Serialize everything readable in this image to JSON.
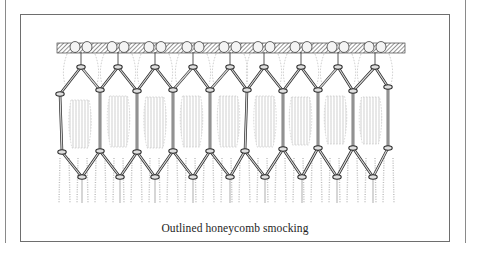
{
  "figure": {
    "caption": "Outlined honeycomb smocking",
    "illustration_subject": "outlined honeycomb smocking stitch diagram",
    "colors": {
      "ink": "#2a2a2a",
      "thread_fill": "#d8d8d8",
      "band_hatch": "#4a4a4a",
      "fabric_shade": "#bdbdbd",
      "frame": "#6e6e6e",
      "rule": "#8a8a8a"
    },
    "geometry": {
      "band": {
        "x1": 57,
        "x2": 405,
        "y1": 43,
        "y2": 53
      },
      "top_nodes": {
        "y": 67,
        "x": [
          81,
          118,
          155,
          193,
          230,
          264,
          301,
          338,
          375
        ]
      },
      "upper_side_nodes": {
        "y": [
          94,
          90,
          91,
          90,
          90,
          90,
          91,
          90,
          91,
          87
        ],
        "x": [
          60,
          100,
          137,
          173,
          210,
          247,
          283,
          318,
          353,
          388
        ]
      },
      "lower_side_nodes": {
        "y": [
          152,
          151,
          152,
          151,
          151,
          151,
          149,
          148,
          148,
          148
        ],
        "x": [
          62,
          100,
          137,
          173,
          210,
          245,
          283,
          318,
          353,
          388
        ]
      },
      "bottom_nodes": {
        "y": 177,
        "x": [
          82,
          120,
          155,
          193,
          230,
          265,
          302,
          337,
          373
        ]
      },
      "hang_bottom_y": 203
    }
  }
}
